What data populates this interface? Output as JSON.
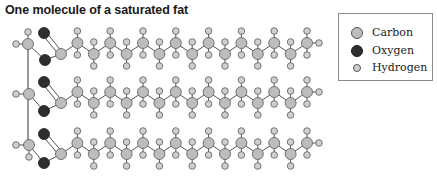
{
  "title": "One molecule of a saturated fat",
  "legend": {
    "items": [
      {
        "label": "Carbon",
        "atom": "carbon"
      },
      {
        "label": "Oxygen",
        "atom": "oxygen"
      },
      {
        "label": "Hydrogen",
        "atom": "hydrogen"
      }
    ]
  },
  "atom_styles": {
    "carbon": {
      "fill": "#bdbdbd",
      "stroke": "#5a5a5a",
      "r": 5.5
    },
    "oxygen": {
      "fill": "#2e2e2e",
      "stroke": "#1a1a1a",
      "r": 5.5
    },
    "hydrogen": {
      "fill": "#cfcfcf",
      "stroke": "#5a5a5a",
      "r": 3.3
    }
  },
  "bond_color": "#555555",
  "molecule": {
    "glycerol_backbone_x": 28,
    "chains": [
      {
        "row": "top",
        "glycerol_c": [
          28,
          44
        ],
        "glycerol_h": [
          [
            16,
            44
          ],
          [
            28,
            32
          ]
        ],
        "o_double": [
          44,
          33
        ],
        "o_ester": [
          45,
          60
        ],
        "base_y": 43
      },
      {
        "row": "middle",
        "glycerol_c": [
          29,
          94
        ],
        "glycerol_h": [
          [
            16,
            94
          ]
        ],
        "o_double": [
          44,
          82
        ],
        "o_ester": [
          44,
          111
        ],
        "base_y": 92
      },
      {
        "row": "bottom",
        "glycerol_c": [
          29,
          145
        ],
        "glycerol_h": [
          [
            16,
            145
          ],
          [
            29,
            157
          ]
        ],
        "o_double": [
          44,
          134
        ],
        "o_ester": [
          44,
          163
        ],
        "base_y": 143
      }
    ],
    "carbons_per_chain": 16,
    "carbon_x_start": 61,
    "carbon_x_step": 16.4,
    "zigzag_amplitude": 11
  }
}
